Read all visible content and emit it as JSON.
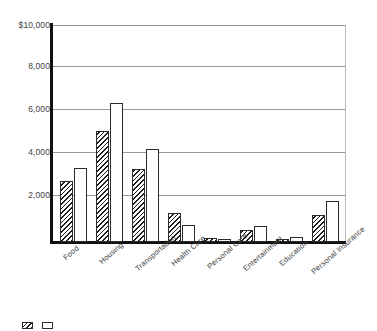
{
  "chart_data": {
    "type": "bar",
    "title": "",
    "subtitle": "",
    "xlabel": "",
    "ylabel": "",
    "ylim": [
      0,
      10000
    ],
    "grid": true,
    "grid_axis": "y",
    "legend_position": "bottom-left",
    "y_ticks": [
      {
        "value": 10000,
        "label": "$10,000"
      },
      {
        "value": 8000,
        "label": "8,000"
      },
      {
        "value": 6000,
        "label": "6,000"
      },
      {
        "value": 4000,
        "label": "4,000"
      },
      {
        "value": 2000,
        "label": "2,000"
      }
    ],
    "categories": [
      "Food",
      "Housing",
      "Transportation",
      "Health Care",
      "Personal Care",
      "Entertainment",
      "Education",
      "Personal Insurance"
    ],
    "series": [
      {
        "name": "Series 1",
        "style": "hatched",
        "values": [
          2800,
          5100,
          3350,
          1350,
          200,
          540,
          130,
          1250
        ]
      },
      {
        "name": "Series 2",
        "style": "plain",
        "values": [
          3400,
          6400,
          4300,
          780,
          130,
          750,
          230,
          1900
        ]
      }
    ],
    "colors": {
      "axis": "#101010",
      "gridline": "#9a9a9a",
      "bar_outline": "#2b2b2b",
      "hatch": "#1d1d1d",
      "plain_fill": "#ffffff",
      "text": "#3d3d3d",
      "background": "#ffffff"
    }
  },
  "legend": {
    "items": [
      {
        "label": "",
        "style": "hatched"
      },
      {
        "label": "",
        "style": "plain"
      }
    ],
    "note": ""
  }
}
